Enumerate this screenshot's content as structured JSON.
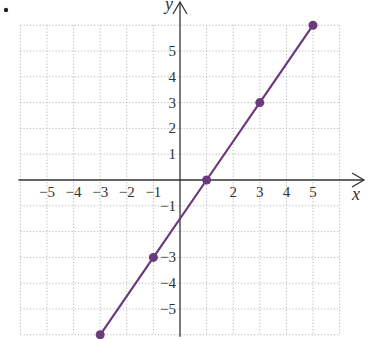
{
  "chart_data": {
    "type": "line",
    "title": "",
    "xlabel": "x",
    "ylabel": "y",
    "xlim": [
      -6,
      6
    ],
    "ylim": [
      -6,
      6
    ],
    "grid": true,
    "grid_style": "dotted",
    "x_tick_labels": [
      "−5",
      "−4",
      "−3",
      "−2",
      "−1",
      "2",
      "3",
      "4",
      "5"
    ],
    "x_tick_values": [
      -5,
      -4,
      -3,
      -2,
      -1,
      2,
      3,
      4,
      5
    ],
    "y_tick_labels": [
      "5",
      "4",
      "3",
      "2",
      "1",
      "−1",
      "−3",
      "−4",
      "−5"
    ],
    "y_tick_values": [
      5,
      4,
      3,
      2,
      1,
      -1,
      -3,
      -4,
      -5
    ],
    "series": [
      {
        "name": "line",
        "color": "#6b3a7d",
        "x": [
          -3,
          -1,
          1,
          3,
          5
        ],
        "y": [
          -6,
          -3,
          0,
          3,
          6
        ]
      }
    ],
    "points": [
      {
        "x": -3,
        "y": -6
      },
      {
        "x": -1,
        "y": -3
      },
      {
        "x": 1,
        "y": 0
      },
      {
        "x": 3,
        "y": 3
      },
      {
        "x": 5,
        "y": 6
      }
    ]
  },
  "bullet": "•",
  "colors": {
    "line": "#6b3a7d",
    "point": "#6b3a7d",
    "axis": "#333333",
    "grid": "#b8b8b8"
  }
}
